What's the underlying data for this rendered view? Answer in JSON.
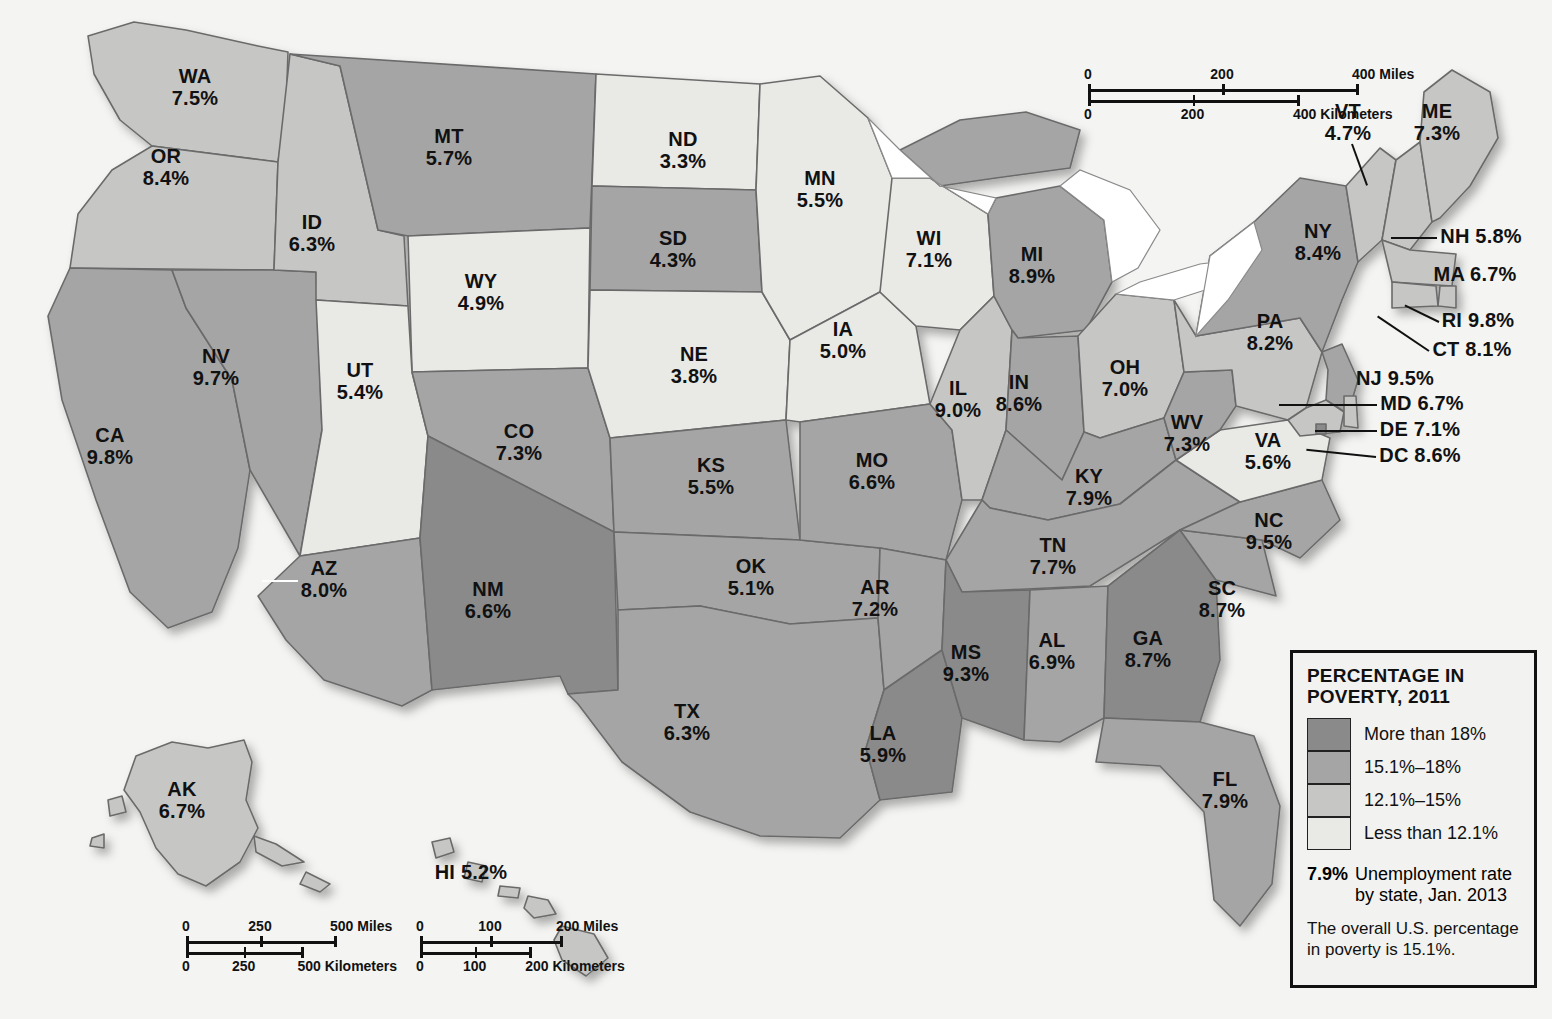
{
  "legend": {
    "title": "PERCENTAGE IN POVERTY, 2011",
    "title_line1": "PERCENTAGE IN",
    "title_line2": "POVERTY, 2011",
    "classes": [
      {
        "label": "More than 18%",
        "color": "#8a8a8a",
        "range_min": 18.1,
        "range_max": null
      },
      {
        "label": "15.1%–18%",
        "color": "#a5a5a5",
        "range_min": 15.1,
        "range_max": 18.0
      },
      {
        "label": "12.1%–15%",
        "color": "#c6c6c4",
        "range_min": 12.1,
        "range_max": 15.0
      },
      {
        "label": "Less than 12.1%",
        "color": "#e9e9e6",
        "range_min": null,
        "range_max": 12.0
      }
    ],
    "unemployment_rate_example": "7.9%",
    "unemployment_caption_line1": "Unemployment rate",
    "unemployment_caption_line2": "by state, Jan. 2013",
    "note": "The overall U.S. percentage in poverty is 15.1%."
  },
  "scale_bars": [
    {
      "name": "main",
      "miles": [
        "0",
        "200",
        "400 Miles"
      ],
      "kilometers": [
        "0",
        "200",
        "400 Kilometers"
      ]
    },
    {
      "name": "alaska",
      "miles": [
        "0",
        "250",
        "500 Miles"
      ],
      "kilometers": [
        "0",
        "250",
        "500 Kilometers"
      ]
    },
    {
      "name": "hawaii",
      "miles": [
        "0",
        "100",
        "200 Miles"
      ],
      "kilometers": [
        "0",
        "100",
        "200 Kilometers"
      ]
    }
  ],
  "chart_data": {
    "type": "map",
    "title": "PERCENTAGE IN POVERTY, 2011",
    "value_field": "unemployment_rate_jan_2013_percent",
    "fill_field": "poverty_class_2011",
    "overall_us_poverty_percent": 15.1,
    "states": [
      {
        "ab": "WA",
        "pct": "7.5%",
        "cls": 2,
        "x": 195,
        "y": 88,
        "style": "stack"
      },
      {
        "ab": "OR",
        "pct": "8.4%",
        "cls": 2,
        "x": 166,
        "y": 168,
        "style": "stack"
      },
      {
        "ab": "CA",
        "pct": "9.8%",
        "cls": 1,
        "x": 110,
        "y": 447,
        "style": "stack"
      },
      {
        "ab": "NV",
        "pct": "9.7%",
        "cls": 1,
        "x": 216,
        "y": 368,
        "style": "stack"
      },
      {
        "ab": "ID",
        "pct": "6.3%",
        "cls": 2,
        "x": 312,
        "y": 234,
        "style": "stack"
      },
      {
        "ab": "MT",
        "pct": "5.7%",
        "cls": 1,
        "x": 449,
        "y": 148,
        "style": "stack"
      },
      {
        "ab": "WY",
        "pct": "4.9%",
        "cls": 3,
        "x": 481,
        "y": 293,
        "style": "stack"
      },
      {
        "ab": "UT",
        "pct": "5.4%",
        "cls": 3,
        "x": 360,
        "y": 382,
        "style": "stack"
      },
      {
        "ab": "AZ",
        "pct": "8.0%",
        "cls": 1,
        "x": 324,
        "y": 580,
        "style": "stack",
        "leader": {
          "len": 36,
          "angle": 180,
          "white": true
        }
      },
      {
        "ab": "CO",
        "pct": "7.3%",
        "cls": 1,
        "x": 519,
        "y": 443,
        "style": "stack"
      },
      {
        "ab": "NM",
        "pct": "6.6%",
        "cls": 0,
        "x": 488,
        "y": 601,
        "style": "stack"
      },
      {
        "ab": "ND",
        "pct": "3.3%",
        "cls": 3,
        "x": 683,
        "y": 151,
        "style": "stack"
      },
      {
        "ab": "SD",
        "pct": "4.3%",
        "cls": 1,
        "x": 673,
        "y": 250,
        "style": "stack"
      },
      {
        "ab": "NE",
        "pct": "3.8%",
        "cls": 3,
        "x": 694,
        "y": 366,
        "style": "stack"
      },
      {
        "ab": "KS",
        "pct": "5.5%",
        "cls": 1,
        "x": 711,
        "y": 477,
        "style": "stack"
      },
      {
        "ab": "OK",
        "pct": "5.1%",
        "cls": 1,
        "x": 751,
        "y": 578,
        "style": "stack"
      },
      {
        "ab": "TX",
        "pct": "6.3%",
        "cls": 1,
        "x": 687,
        "y": 723,
        "style": "stack"
      },
      {
        "ab": "MN",
        "pct": "5.5%",
        "cls": 3,
        "x": 820,
        "y": 190,
        "style": "stack"
      },
      {
        "ab": "IA",
        "pct": "5.0%",
        "cls": 3,
        "x": 843,
        "y": 341,
        "style": "stack"
      },
      {
        "ab": "MO",
        "pct": "6.6%",
        "cls": 1,
        "x": 872,
        "y": 472,
        "style": "stack"
      },
      {
        "ab": "AR",
        "pct": "7.2%",
        "cls": 1,
        "x": 875,
        "y": 599,
        "style": "stack"
      },
      {
        "ab": "LA",
        "pct": "5.9%",
        "cls": 0,
        "x": 883,
        "y": 745,
        "style": "stack"
      },
      {
        "ab": "WI",
        "pct": "7.1%",
        "cls": 3,
        "x": 929,
        "y": 250,
        "style": "stack"
      },
      {
        "ab": "IL",
        "pct": "9.0%",
        "cls": 2,
        "x": 958,
        "y": 400,
        "style": "stack"
      },
      {
        "ab": "MI",
        "pct": "8.9%",
        "cls": 1,
        "x": 1032,
        "y": 266,
        "style": "stack"
      },
      {
        "ab": "IN",
        "pct": "8.6%",
        "cls": 1,
        "x": 1019,
        "y": 394,
        "style": "stack"
      },
      {
        "ab": "OH",
        "pct": "7.0%",
        "cls": 2,
        "x": 1125,
        "y": 379,
        "style": "stack"
      },
      {
        "ab": "KY",
        "pct": "7.9%",
        "cls": 1,
        "x": 1089,
        "y": 488,
        "style": "stack"
      },
      {
        "ab": "TN",
        "pct": "7.7%",
        "cls": 1,
        "x": 1053,
        "y": 557,
        "style": "stack"
      },
      {
        "ab": "MS",
        "pct": "9.3%",
        "cls": 0,
        "x": 966,
        "y": 664,
        "style": "stack"
      },
      {
        "ab": "AL",
        "pct": "6.9%",
        "cls": 1,
        "x": 1052,
        "y": 652,
        "style": "stack"
      },
      {
        "ab": "GA",
        "pct": "8.7%",
        "cls": 0,
        "x": 1148,
        "y": 650,
        "style": "stack"
      },
      {
        "ab": "FL",
        "pct": "7.9%",
        "cls": 1,
        "x": 1225,
        "y": 791,
        "style": "stack"
      },
      {
        "ab": "SC",
        "pct": "8.7%",
        "cls": 1,
        "x": 1222,
        "y": 600,
        "style": "stack"
      },
      {
        "ab": "NC",
        "pct": "9.5%",
        "cls": 1,
        "x": 1269,
        "y": 532,
        "style": "stack"
      },
      {
        "ab": "VA",
        "pct": "5.6%",
        "cls": 3,
        "x": 1268,
        "y": 452,
        "style": "stack"
      },
      {
        "ab": "WV",
        "pct": "7.3%",
        "cls": 1,
        "x": 1187,
        "y": 434,
        "style": "stack"
      },
      {
        "ab": "PA",
        "pct": "8.2%",
        "cls": 2,
        "x": 1270,
        "y": 333,
        "style": "stack"
      },
      {
        "ab": "NY",
        "pct": "8.4%",
        "cls": 1,
        "x": 1318,
        "y": 243,
        "style": "stack"
      },
      {
        "ab": "VT",
        "pct": "4.7%",
        "cls": 2,
        "x": 1348,
        "y": 123,
        "style": "stack",
        "leader": {
          "len": 44,
          "angle": 70
        }
      },
      {
        "ab": "ME",
        "pct": "7.3%",
        "cls": 2,
        "x": 1437,
        "y": 123,
        "style": "stack"
      },
      {
        "ab": "NH",
        "pct": "5.8%",
        "cls": 2,
        "x": 1481,
        "y": 237,
        "style": "inline",
        "leader": {
          "len": 46,
          "angle": 180
        }
      },
      {
        "ab": "MA",
        "pct": "6.7%",
        "cls": 2,
        "x": 1475,
        "y": 275,
        "style": "inline"
      },
      {
        "ab": "RI",
        "pct": "9.8%",
        "cls": 2,
        "x": 1478,
        "y": 321,
        "style": "inline",
        "leader": {
          "len": 38,
          "angle": 206
        }
      },
      {
        "ab": "CT",
        "pct": "8.1%",
        "cls": 2,
        "x": 1472,
        "y": 350,
        "style": "inline",
        "leader": {
          "len": 62,
          "angle": 214
        }
      },
      {
        "ab": "NJ",
        "pct": "9.5%",
        "cls": 1,
        "x": 1395,
        "y": 379,
        "style": "inline"
      },
      {
        "ab": "MD",
        "pct": "6.7%",
        "cls": 2,
        "x": 1422,
        "y": 404,
        "style": "inline",
        "leader": {
          "len": 98,
          "angle": 180
        }
      },
      {
        "ab": "DE",
        "pct": "7.1%",
        "cls": 2,
        "x": 1420,
        "y": 430,
        "style": "inline",
        "leader": {
          "len": 62,
          "angle": 180
        }
      },
      {
        "ab": "DC",
        "pct": "8.6%",
        "cls": 0,
        "x": 1420,
        "y": 456,
        "style": "inline",
        "leader": {
          "len": 70,
          "angle": 186
        }
      },
      {
        "ab": "AK",
        "pct": "6.7%",
        "cls": 2,
        "x": 182,
        "y": 801,
        "style": "stack"
      },
      {
        "ab": "HI",
        "pct": "5.2%",
        "cls": 2,
        "x": 471,
        "y": 873,
        "style": "inline"
      }
    ]
  }
}
